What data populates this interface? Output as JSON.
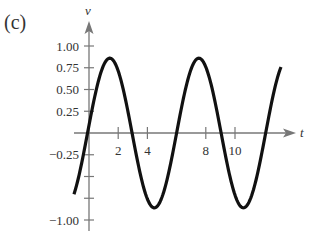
{
  "panel_label": "(c)",
  "chart_data": {
    "type": "line",
    "title": "",
    "xlabel": "t",
    "ylabel": "v",
    "x_ticks": [
      2,
      4,
      8,
      10
    ],
    "x_tick_labels": [
      "2",
      "4",
      "8",
      "10"
    ],
    "x_minor_ticks": [
      6
    ],
    "y_ticks": [
      1.0,
      0.75,
      0.5,
      0.25,
      -0.25,
      -0.5,
      -0.75,
      -1.0
    ],
    "y_tick_labels": [
      "1.00",
      "0.75",
      "0.50",
      "0.25",
      "",
      "",
      "",
      ""
    ],
    "y_tick_labels_neg": [
      {
        "value": -0.25,
        "label": "-0.25"
      },
      {
        "value": -1.0,
        "label": "-1.00"
      }
    ],
    "xlim": [
      -1.03,
      13.15
    ],
    "ylim": [
      -1.1,
      1.1
    ],
    "grid": false,
    "legend": null,
    "series": [
      {
        "name": "v(t)",
        "approx_formula": "v = 0.86 sin(2*pi*(t+0.1)/6.1)",
        "x": [
          -1.03,
          -0.5,
          0,
          0.5,
          1.0,
          1.5,
          2.0,
          2.5,
          3.0,
          3.5,
          4.0,
          4.5,
          5.0,
          5.5,
          6.0,
          6.5,
          7.0,
          7.5,
          8.0,
          8.5,
          9.0,
          9.5,
          10.0,
          10.5,
          11.0,
          11.5,
          12.0,
          12.5,
          13.15
        ],
        "y": [
          -0.7,
          -0.34,
          0.09,
          0.5,
          0.78,
          0.86,
          0.71,
          0.38,
          -0.04,
          -0.46,
          -0.76,
          -0.86,
          -0.74,
          -0.43,
          0.0,
          0.42,
          0.74,
          0.86,
          0.76,
          0.46,
          0.05,
          -0.38,
          -0.71,
          -0.86,
          -0.78,
          -0.5,
          -0.09,
          0.34,
          0.75
        ]
      }
    ]
  },
  "colors": {
    "curve": "#111111",
    "axis": "#777777",
    "text": "#333333"
  }
}
